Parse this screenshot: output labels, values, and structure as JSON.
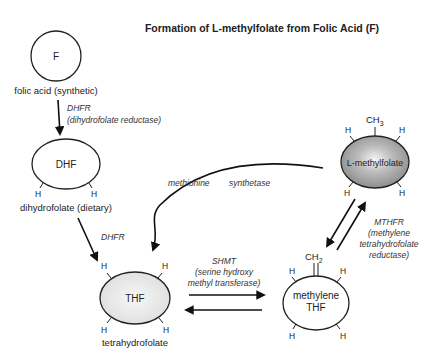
{
  "title": "Formation of L-methylfolate from Folic Acid (F)",
  "nodes": {
    "folic_acid": {
      "symbol": "F",
      "label": "folic acid (synthetic)"
    },
    "dhf": {
      "symbol": "DHF",
      "label": "dihydrofolate (dietary)",
      "h_left": "H",
      "h_right": "H"
    },
    "thf": {
      "symbol": "THF",
      "label": "tetrahydrofolate",
      "h": [
        "H",
        "H",
        "H",
        "H"
      ]
    },
    "methylene_thf": {
      "symbol_line1": "methylene",
      "symbol_line2": "THF",
      "group": "CH",
      "group_sub": "2",
      "h": [
        "H",
        "H",
        "H",
        "H"
      ]
    },
    "l_methylfolate": {
      "symbol": "L-methylfolate",
      "group": "CH",
      "group_sub": "3",
      "h": [
        "H",
        "H",
        "H",
        "H"
      ],
      "fill_color": "#9a9a9a"
    }
  },
  "enzymes": {
    "dhfr_1_line1": "DHFR",
    "dhfr_1_line2": "(dihydrofolate reductase)",
    "dhfr_2": "DHFR",
    "methionine_part1": "methionine",
    "methionine_part2": "synthetase",
    "shmt_line1": "SHMT",
    "shmt_line2": "(serine hydroxy",
    "shmt_line3": "methyl transferase)",
    "mthfr_line1": "MTHFR",
    "mthfr_line2": "(methylene",
    "mthfr_line3": "tetrahydrofolate",
    "mthfr_line4": "reductase)"
  }
}
